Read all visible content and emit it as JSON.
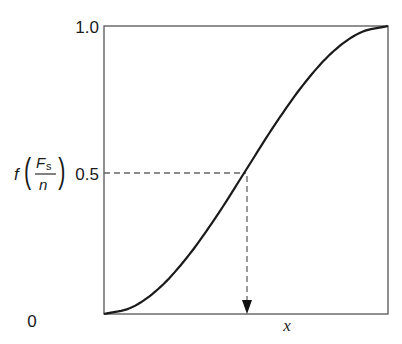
{
  "chart_data": {
    "type": "line",
    "title": "",
    "xlabel": "x",
    "ylabel": "f(Fs/n)",
    "ylabel_parts": {
      "f": "f",
      "numerator": "F",
      "numerator_sub": "s",
      "denominator": "n"
    },
    "y_ticks": [
      "0",
      "0.5",
      "1.0"
    ],
    "x_ticks": [],
    "xlim": [
      0,
      1
    ],
    "ylim": [
      0,
      1
    ],
    "grid": false,
    "legend": null,
    "series": [
      {
        "name": "cumulative curve",
        "x": [
          0,
          0.1,
          0.2,
          0.3,
          0.4,
          0.5,
          0.6,
          0.7,
          0.8,
          0.9,
          1.0
        ],
        "values": [
          0,
          0.024,
          0.095,
          0.206,
          0.345,
          0.5,
          0.655,
          0.794,
          0.905,
          0.976,
          1.0
        ]
      }
    ],
    "annotations": [
      {
        "type": "dashed-horizontal",
        "y": 0.5,
        "from_x": 0,
        "to_x": 0.5
      },
      {
        "type": "dashed-arrow-down",
        "x": 0.5,
        "from_y": 0.5,
        "to_y": 0
      }
    ]
  }
}
